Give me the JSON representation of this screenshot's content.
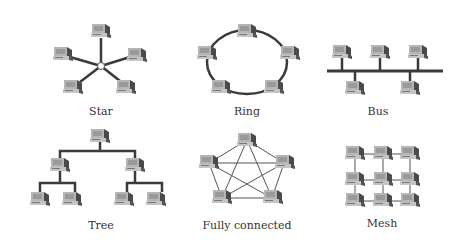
{
  "diagram": {
    "topologies": [
      {
        "id": "star",
        "label": "Star"
      },
      {
        "id": "ring",
        "label": "Ring"
      },
      {
        "id": "bus",
        "label": "Bus"
      },
      {
        "id": "tree",
        "label": "Tree"
      },
      {
        "id": "fully-connected",
        "label": "Fully connected"
      },
      {
        "id": "mesh",
        "label": "Mesh"
      }
    ],
    "node_icon": "computer-icon",
    "colors": {
      "link": "#3a3a3a",
      "node_light": "#b8b8b8",
      "node_dark": "#4a4a4a"
    }
  }
}
